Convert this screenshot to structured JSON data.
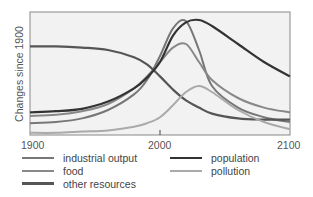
{
  "chart_data": {
    "type": "line",
    "title": "",
    "xlabel": "",
    "ylabel": "Changes since 1900",
    "x_ticks": [
      "1900",
      "2000",
      "2100"
    ],
    "xlim": [
      1900,
      2100
    ],
    "ylim": [
      0,
      100
    ],
    "grid": false,
    "legend_position": "bottom",
    "x": [
      1900,
      1920,
      1940,
      1960,
      1980,
      1990,
      2000,
      2010,
      2020,
      2030,
      2040,
      2060,
      2080,
      2100
    ],
    "series": [
      {
        "name": "industrial output",
        "color": "#777777",
        "values": [
          9,
          10,
          13,
          20,
          33,
          45,
          65,
          88,
          94,
          70,
          40,
          22,
          14,
          10
        ]
      },
      {
        "name": "food",
        "color": "#888888",
        "values": [
          15,
          16,
          19,
          25,
          38,
          48,
          60,
          72,
          75,
          60,
          45,
          30,
          22,
          18
        ]
      },
      {
        "name": "other resources",
        "color": "#555555",
        "values": [
          73,
          73,
          72,
          70,
          64,
          58,
          48,
          37,
          28,
          22,
          17,
          13,
          12,
          12
        ]
      },
      {
        "name": "population",
        "color": "#333333",
        "values": [
          18,
          19,
          21,
          27,
          38,
          47,
          60,
          82,
          93,
          95,
          90,
          75,
          60,
          48
        ]
      },
      {
        "name": "pollution",
        "color": "#aaaaaa",
        "values": [
          1,
          1,
          2,
          3,
          6,
          9,
          14,
          24,
          35,
          40,
          35,
          20,
          10,
          4
        ]
      }
    ]
  },
  "axis": {
    "ylabel": "Changes since 1900",
    "ticks": [
      "1900",
      "2000",
      "2100"
    ]
  },
  "legend": [
    {
      "label": "industrial output",
      "color": "#777777"
    },
    {
      "label": "food",
      "color": "#888888"
    },
    {
      "label": "other resources",
      "color": "#555555"
    },
    {
      "label": "population",
      "color": "#333333"
    },
    {
      "label": "pollution",
      "color": "#aaaaaa"
    }
  ]
}
